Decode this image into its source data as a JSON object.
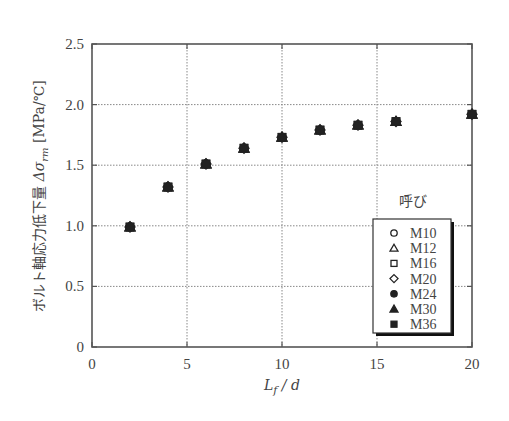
{
  "chart_data": {
    "type": "scatter",
    "title": "",
    "xlabel": "L_f / d",
    "xlabel_parts": {
      "main": "L",
      "sub": "f",
      "rest": " / d"
    },
    "ylabel": "ボルト軸応力低下量 Δσ_rm [MPa/℃]",
    "ylabel_parts": {
      "jp": "ボルト軸応力低下量 ",
      "sym": "Δσ",
      "sub": "rm",
      "unit": " [MPa/℃]"
    },
    "xlim": [
      0,
      20
    ],
    "ylim": [
      0,
      2.5
    ],
    "x_ticks": [
      0,
      5,
      10,
      15,
      20
    ],
    "x_tick_labels": [
      "0",
      "5",
      "10",
      "15",
      "20"
    ],
    "y_ticks": [
      0,
      0.5,
      1.0,
      1.5,
      2.0,
      2.5
    ],
    "y_tick_labels": [
      "0",
      "0.5",
      "1.0",
      "1.5",
      "2.0",
      "2.5"
    ],
    "grid": true,
    "grid_style": "dotted",
    "legend": {
      "title": "呼び",
      "position": "lower right",
      "entries": [
        {
          "label": "M10",
          "marker": "circle-open"
        },
        {
          "label": "M12",
          "marker": "triangle-open"
        },
        {
          "label": "M16",
          "marker": "square-open"
        },
        {
          "label": "M20",
          "marker": "diamond-open"
        },
        {
          "label": "M24",
          "marker": "circle-filled"
        },
        {
          "label": "M30",
          "marker": "triangle-filled"
        },
        {
          "label": "M36",
          "marker": "square-filled"
        }
      ]
    },
    "x": [
      2,
      4,
      6,
      8,
      10,
      12,
      14,
      16,
      20
    ],
    "series": [
      {
        "name": "M10",
        "values": [
          0.99,
          1.32,
          1.51,
          1.64,
          1.73,
          1.79,
          1.83,
          1.86,
          1.92
        ]
      },
      {
        "name": "M12",
        "values": [
          0.99,
          1.32,
          1.51,
          1.64,
          1.73,
          1.79,
          1.83,
          1.86,
          1.92
        ]
      },
      {
        "name": "M16",
        "values": [
          0.99,
          1.32,
          1.51,
          1.64,
          1.73,
          1.79,
          1.83,
          1.86,
          1.92
        ]
      },
      {
        "name": "M20",
        "values": [
          0.99,
          1.32,
          1.51,
          1.64,
          1.73,
          1.79,
          1.83,
          1.86,
          1.92
        ]
      },
      {
        "name": "M24",
        "values": [
          0.99,
          1.32,
          1.51,
          1.64,
          1.73,
          1.79,
          1.83,
          1.86,
          1.92
        ]
      },
      {
        "name": "M30",
        "values": [
          0.99,
          1.32,
          1.51,
          1.64,
          1.73,
          1.79,
          1.83,
          1.86,
          1.92
        ]
      },
      {
        "name": "M36",
        "values": [
          0.99,
          1.32,
          1.51,
          1.64,
          1.73,
          1.79,
          1.83,
          1.86,
          1.92
        ]
      }
    ],
    "colors": {
      "axis": "#555555",
      "grid": "#888888",
      "marker": "#222222"
    }
  }
}
